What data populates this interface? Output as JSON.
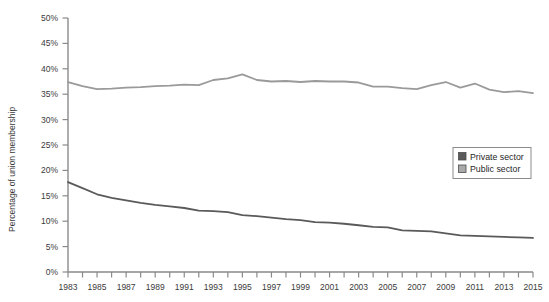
{
  "chart_data": {
    "type": "line",
    "title": "",
    "xlabel": "",
    "ylabel": "Percentage of union membership",
    "xlim": [
      1983,
      2015
    ],
    "ylim": [
      0,
      50
    ],
    "yticks": [
      0,
      5,
      10,
      15,
      20,
      25,
      30,
      35,
      40,
      45,
      50
    ],
    "ytick_labels": [
      "0%",
      "5%",
      "10%",
      "15%",
      "20%",
      "25%",
      "30%",
      "35%",
      "40%",
      "45%",
      "50%"
    ],
    "x": [
      1983,
      1984,
      1985,
      1986,
      1987,
      1988,
      1989,
      1990,
      1991,
      1992,
      1993,
      1994,
      1995,
      1996,
      1997,
      1998,
      1999,
      2000,
      2001,
      2002,
      2003,
      2004,
      2005,
      2006,
      2007,
      2008,
      2009,
      2010,
      2011,
      2012,
      2013,
      2014,
      2015
    ],
    "xtick_labels": [
      "1983",
      "",
      "1985",
      "",
      "1987",
      "",
      "1989",
      "",
      "1991",
      "",
      "1993",
      "",
      "1995",
      "",
      "1997",
      "",
      "1999",
      "",
      "2001",
      "",
      "2003",
      "",
      "2005",
      "",
      "2007",
      "",
      "2009",
      "",
      "2011",
      "",
      "2013",
      "",
      "2015"
    ],
    "xticks_minor_every_year": true,
    "grid": false,
    "legend_position": "center-right",
    "series": [
      {
        "name": "Private sector",
        "color": "#5a5a5a",
        "values": [
          17.7,
          16.5,
          15.3,
          14.6,
          14.1,
          13.6,
          13.2,
          12.9,
          12.6,
          12.1,
          12.0,
          11.8,
          11.2,
          11.0,
          10.7,
          10.4,
          10.2,
          9.8,
          9.7,
          9.5,
          9.2,
          8.9,
          8.8,
          8.2,
          8.1,
          8.0,
          7.6,
          7.2,
          7.1,
          7.0,
          6.9,
          6.8,
          6.7
        ]
      },
      {
        "name": "Public sector",
        "color": "#9a9a9a",
        "values": [
          37.4,
          36.6,
          36.0,
          36.1,
          36.3,
          36.4,
          36.6,
          36.7,
          36.9,
          36.8,
          37.8,
          38.1,
          38.9,
          37.8,
          37.5,
          37.6,
          37.4,
          37.6,
          37.5,
          37.5,
          37.3,
          36.5,
          36.5,
          36.2,
          36.0,
          36.8,
          37.4,
          36.3,
          37.1,
          35.9,
          35.4,
          35.6,
          35.2
        ]
      }
    ]
  },
  "legend": {
    "items": [
      {
        "label": "Private sector",
        "color": "#5a5a5a"
      },
      {
        "label": "Public sector",
        "color": "#a9a9a9"
      }
    ]
  },
  "axis": {
    "y_title": "Percentage of union membership"
  }
}
